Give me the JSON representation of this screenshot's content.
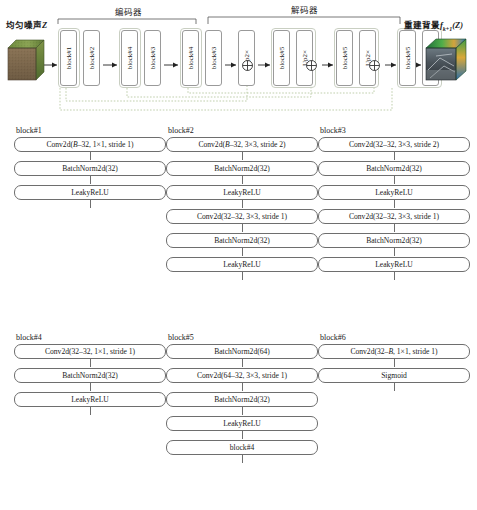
{
  "pipeline": {
    "input_label_main": "均匀噪声",
    "input_label_var": "Z",
    "output_label_main": "重建背景",
    "output_label_fn": "f",
    "output_label_sub": "k+1",
    "output_label_arg": "(Z)",
    "encoder_label": "编码器",
    "decoder_label": "解码器",
    "blocks": [
      {
        "label": "block#1"
      },
      {
        "label": "block#2"
      },
      {
        "label": "block#4"
      },
      {
        "label": "block#3"
      },
      {
        "label": "block#4"
      },
      {
        "label": "block#3"
      },
      {
        "label": "Up2×"
      },
      {
        "label": "block#5"
      },
      {
        "label": "Up2×"
      },
      {
        "label": "block#5"
      },
      {
        "label": "Up2×"
      },
      {
        "label": "block#5"
      },
      {
        "label": "block#6"
      }
    ],
    "sum_symbol": "⊕"
  },
  "block_defs": [
    {
      "title": "block#1",
      "rows": [
        "Conv2d(B–32, 1×1, stride 1)",
        "BatchNorm2d(32)",
        "LeakyReLU"
      ]
    },
    {
      "title": "block#2",
      "rows": [
        "Conv2d(B–32, 3×3, stride 2)",
        "BatchNorm2d(32)",
        "LeakyReLU",
        "Conv2d(32–32, 3×3, stride 1)",
        "BatchNorm2d(32)",
        "LeakyReLU"
      ]
    },
    {
      "title": "block#3",
      "rows": [
        "Conv2d(32–32, 3×3, stride 2)",
        "BatchNorm2d(32)",
        "LeakyReLU",
        "Conv2d(32–32, 3×3, stride 1)",
        "BatchNorm2d(32)",
        "LeakyReLU"
      ]
    },
    {
      "title": "block#4",
      "rows": [
        "Conv2d(32–32, 1×1, stride 1)",
        "BatchNorm2d(32)",
        "LeakyReLU"
      ]
    },
    {
      "title": "block#5",
      "rows": [
        "BatchNorm2d(64)",
        "Conv2d(64–32, 3×3, stride 1)",
        "BatchNorm2d(32)",
        "LeakyReLU",
        "block#4"
      ]
    },
    {
      "title": "block#6",
      "rows": [
        "Conv2d(32–B, 1×1, stride 1)",
        "Sigmoid"
      ]
    }
  ],
  "colors": {
    "skip_connection": "#b9c9a4",
    "group_border": "#c9cfc2",
    "box_border": "#6e6e6e",
    "vblock_border": "#9a9a9a"
  }
}
